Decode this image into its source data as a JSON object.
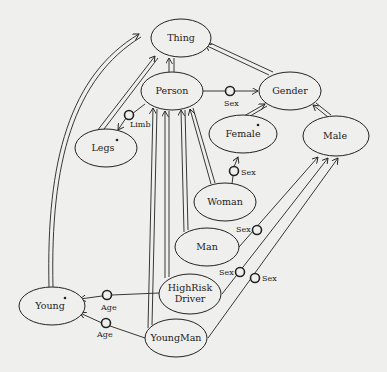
{
  "diagram": {
    "type": "semantic-network",
    "background": "#efefed",
    "ink": "#222222",
    "nodes": [
      {
        "id": "thing",
        "label": "Thing",
        "cx": 181,
        "cy": 38,
        "rx": 30,
        "ry": 19,
        "primitive": false
      },
      {
        "id": "person",
        "label": "Person",
        "cx": 172,
        "cy": 91,
        "rx": 31,
        "ry": 19,
        "primitive": false
      },
      {
        "id": "gender",
        "label": "Gender",
        "cx": 290,
        "cy": 91,
        "rx": 31,
        "ry": 19,
        "primitive": false
      },
      {
        "id": "legs",
        "label": "Legs",
        "cx": 106,
        "cy": 148,
        "rx": 31,
        "ry": 19,
        "primitive": true
      },
      {
        "id": "female",
        "label": "Female",
        "cx": 243,
        "cy": 134,
        "rx": 34,
        "ry": 19,
        "primitive": true
      },
      {
        "id": "male",
        "label": "Male",
        "cx": 336,
        "cy": 136,
        "rx": 33,
        "ry": 20,
        "primitive": false
      },
      {
        "id": "woman",
        "label": "Woman",
        "cx": 225,
        "cy": 202,
        "rx": 31,
        "ry": 19,
        "primitive": false
      },
      {
        "id": "man",
        "label": "Man",
        "cx": 207,
        "cy": 247,
        "rx": 32,
        "ry": 19,
        "primitive": false
      },
      {
        "id": "highrisk",
        "label": "HighRisk\nDriver",
        "cx": 190,
        "cy": 294,
        "rx": 31,
        "ry": 20,
        "primitive": false
      },
      {
        "id": "young",
        "label": "Young",
        "cx": 52,
        "cy": 306,
        "rx": 33,
        "ry": 19,
        "primitive": true
      },
      {
        "id": "youngman",
        "label": "YoungMan",
        "cx": 176,
        "cy": 338,
        "rx": 31,
        "ry": 19,
        "primitive": false
      }
    ],
    "labels": {
      "thing": "Thing",
      "person": "Person",
      "gender": "Gender",
      "legs": "Legs",
      "female": "Female",
      "male": "Male",
      "woman": "Woman",
      "man": "Man",
      "highrisk_line1": "HighRisk",
      "highrisk_line2": "Driver",
      "young": "Young",
      "youngman": "YoungMan"
    },
    "subsumption_links": [
      {
        "from": "person",
        "to": "thing"
      },
      {
        "from": "gender",
        "to": "thing"
      },
      {
        "from": "legs",
        "to": "thing"
      },
      {
        "from": "young",
        "to": "thing"
      },
      {
        "from": "female",
        "to": "gender"
      },
      {
        "from": "male",
        "to": "gender"
      },
      {
        "from": "woman",
        "to": "person"
      },
      {
        "from": "man",
        "to": "person"
      },
      {
        "from": "highrisk",
        "to": "person"
      },
      {
        "from": "youngman",
        "to": "person"
      },
      {
        "from": "man",
        "to": "male"
      },
      {
        "from": "highrisk",
        "to": "male"
      },
      {
        "from": "youngman",
        "to": "male"
      }
    ],
    "role_links": [
      {
        "from": "person",
        "to": "gender",
        "role": "Sex"
      },
      {
        "from": "person",
        "to": "legs",
        "role": "Limb"
      },
      {
        "from": "woman",
        "to": "female",
        "role": "Sex"
      },
      {
        "from": "man",
        "to": "male",
        "role": "Sex"
      },
      {
        "from": "highrisk",
        "to": "male",
        "role": "Sex"
      },
      {
        "from": "youngman",
        "to": "male",
        "role": "Sex"
      },
      {
        "from": "highrisk",
        "to": "young",
        "role": "Age"
      },
      {
        "from": "youngman",
        "to": "young",
        "role": "Age"
      }
    ],
    "roles": {
      "person_sex": "Sex",
      "person_limb": "Limb",
      "woman_sex": "Sex",
      "man_sex": "Sex",
      "highrisk_sex": "Sex",
      "youngman_sex": "Sex",
      "highrisk_age": "Age",
      "youngman_age": "Age"
    }
  }
}
